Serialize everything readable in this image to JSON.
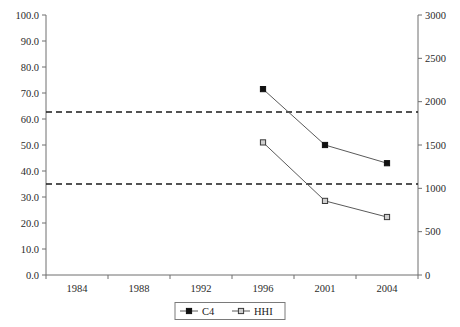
{
  "chart_data": {
    "type": "line",
    "title": "",
    "subtitle": "",
    "xlabel": "",
    "ylabel": "",
    "y2label": "",
    "grid": false,
    "legend_position": "bottom-center",
    "categories": [
      "1984",
      "1988",
      "1992",
      "1996",
      "2001",
      "2004"
    ],
    "series": [
      {
        "name": "C4",
        "axis": "left",
        "marker": "filled-square",
        "values": [
          null,
          null,
          null,
          71.5,
          50.0,
          43.0
        ]
      },
      {
        "name": "HHI",
        "axis": "left_scaled_right",
        "marker": "open-square",
        "values": [
          null,
          null,
          null,
          51.0,
          28.5,
          22.3
        ],
        "right_axis_values": [
          null,
          null,
          null,
          1470,
          820,
          640
        ]
      }
    ],
    "left_axis": {
      "min": 0.0,
      "max": 100.0,
      "step": 10.0,
      "ticks": [
        "0.0",
        "10.0",
        "20.0",
        "30.0",
        "40.0",
        "50.0",
        "60.0",
        "70.0",
        "80.0",
        "90.0",
        "100.0"
      ]
    },
    "right_axis": {
      "min": 0,
      "max": 3000,
      "step": 500,
      "ticks": [
        "0",
        "500",
        "1000",
        "1500",
        "2000",
        "2500",
        "3000"
      ]
    },
    "reference_lines": [
      {
        "name": "upper-threshold",
        "left_value": 62.7,
        "right_value": 1880,
        "style": "dashed"
      },
      {
        "name": "lower-threshold",
        "left_value": 35.0,
        "right_value": 1000,
        "style": "dashed"
      }
    ],
    "legend": [
      {
        "label": "C4",
        "marker": "filled-square"
      },
      {
        "label": "HHI",
        "marker": "open-square"
      }
    ],
    "colors": {
      "series_line": "#5a5a5a",
      "c4_marker": "#111111",
      "hhi_marker": "#cfcfcf",
      "reference_line": "#1a1a1a",
      "axis": "#6f6f6f",
      "background": "#ffffff"
    }
  }
}
